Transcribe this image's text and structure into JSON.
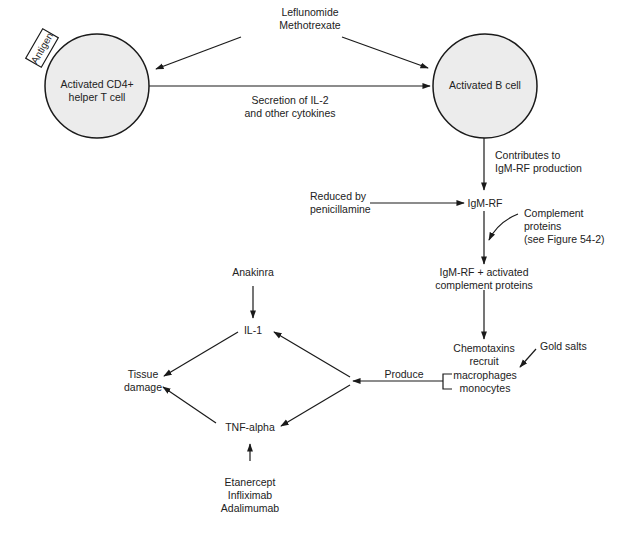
{
  "diagram": {
    "type": "flowchart",
    "nodes": {
      "drugs_top": [
        "Leflunomide",
        "Methotrexate"
      ],
      "t_cell": [
        "Activated CD4+",
        "helper T cell"
      ],
      "antigen": "Antigen",
      "b_cell": "Activated B cell",
      "secretion": [
        "Secretion of IL-2",
        "and other cytokines"
      ],
      "contributes": [
        "Contributes to",
        "IgM-RF production"
      ],
      "reduced_by": [
        "Reduced by",
        "penicillamine"
      ],
      "igm_rf": "IgM-RF",
      "complement": [
        "Complement",
        "proteins",
        "(see Figure 54-2)"
      ],
      "igm_rf_complement": [
        "IgM-RF + activated",
        "complement proteins"
      ],
      "chemotaxins": [
        "Chemotaxins",
        "recruit"
      ],
      "macrophages": "macrophages",
      "monocytes": "monocytes",
      "gold_salts": "Gold salts",
      "produce": "Produce",
      "anakinra": "Anakinra",
      "il1": "IL-1",
      "tissue_damage": [
        "Tissue",
        "damage"
      ],
      "tnf_alpha": "TNF-alpha",
      "anti_tnf": [
        "Etanercept",
        "Infliximab",
        "Adalimumab"
      ]
    },
    "edges": [
      {
        "from": "drugs_top",
        "to": "t_cell"
      },
      {
        "from": "drugs_top",
        "to": "b_cell"
      },
      {
        "from": "t_cell",
        "to": "b_cell",
        "label": "Secretion of IL-2 and other cytokines"
      },
      {
        "from": "b_cell",
        "to": "igm_rf",
        "label": "Contributes to IgM-RF production"
      },
      {
        "from": "reduced_by",
        "to": "igm_rf"
      },
      {
        "from": "igm_rf",
        "to": "igm_rf_complement"
      },
      {
        "from": "complement",
        "to": "igm_rf_complement"
      },
      {
        "from": "igm_rf_complement",
        "to": "chemotaxins"
      },
      {
        "from": "gold_salts",
        "to": "macrophages"
      },
      {
        "from": "macrophages",
        "to": "il1",
        "label": "Produce"
      },
      {
        "from": "macrophages",
        "to": "tnf_alpha",
        "label": "Produce"
      },
      {
        "from": "anakinra",
        "to": "il1"
      },
      {
        "from": "il1",
        "to": "tissue_damage"
      },
      {
        "from": "tnf_alpha",
        "to": "tissue_damage"
      },
      {
        "from": "anti_tnf",
        "to": "tnf_alpha"
      }
    ],
    "colors": {
      "cell_fill": "#ececec",
      "stroke": "#1a1a1a",
      "text": "#222222"
    }
  }
}
